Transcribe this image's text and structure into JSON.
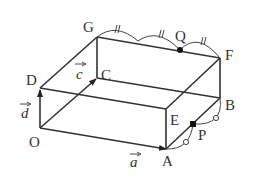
{
  "diagram": {
    "type": "rectangular-prism-vectors",
    "vertices": {
      "O": {
        "label": "O",
        "x": 40,
        "y": 128
      },
      "A": {
        "label": "A",
        "x": 166,
        "y": 149
      },
      "B": {
        "label": "B",
        "x": 220,
        "y": 98
      },
      "C": {
        "label": "C",
        "x": 97,
        "y": 78
      },
      "D": {
        "label": "D",
        "x": 40,
        "y": 88
      },
      "E": {
        "label": "E",
        "x": 166,
        "y": 109
      },
      "F": {
        "label": "F",
        "x": 220,
        "y": 58
      },
      "G": {
        "label": "G",
        "x": 97,
        "y": 37
      }
    },
    "points": {
      "P": {
        "label": "P",
        "on_segment": "AB",
        "marker": "circle-equal"
      },
      "Q": {
        "label": "Q",
        "on_segment": "GF",
        "marker": "double-tick-equal"
      }
    },
    "vectors": {
      "a": {
        "label": "a",
        "from": "O",
        "to": "A"
      },
      "c": {
        "label": "c",
        "from": "O",
        "to": "C"
      },
      "d": {
        "label": "d",
        "from": "O",
        "to": "D"
      }
    },
    "equal_marks": {
      "GQ_QF": "//",
      "AP_PB": "o"
    },
    "colors": {
      "line": "#333333",
      "background": "#ffffff"
    }
  }
}
